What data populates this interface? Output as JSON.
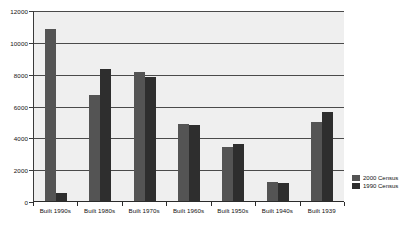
{
  "chart_data": {
    "type": "bar",
    "title": "",
    "xlabel": "",
    "ylabel": "",
    "ylim": [
      0,
      12000
    ],
    "yticks": [
      0,
      2000,
      4000,
      6000,
      8000,
      10000,
      12000
    ],
    "ytick_labels": [
      "0",
      "2000",
      "4000",
      "6000",
      "8000",
      "10000",
      "12000"
    ],
    "grid": true,
    "legend_position": "right-bottom",
    "categories": [
      "Built 1990s",
      "Built 1980s",
      "Built 1970s",
      "Built 1960s",
      "Built 1950s",
      "Built 1940s",
      "Built 1939"
    ],
    "series": [
      {
        "name": "2000 Census",
        "color": "#545454",
        "values": [
          10900,
          6700,
          8150,
          4900,
          3450,
          1250,
          5050
        ]
      },
      {
        "name": "1990 Census",
        "color": "#2e2e2e",
        "values": [
          550,
          8350,
          7850,
          4850,
          3650,
          1200,
          5650
        ]
      }
    ]
  },
  "legend": {
    "items": [
      {
        "label": "2000 Census"
      },
      {
        "label": "1990 Census"
      }
    ]
  },
  "caption": {
    "text": ""
  }
}
